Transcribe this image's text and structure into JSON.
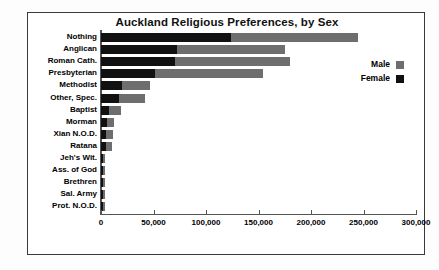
{
  "chart_data": {
    "type": "bar",
    "orientation": "horizontal",
    "stacked": true,
    "title": "Auckland Religious Preferences, by Sex",
    "xlabel": "",
    "ylabel": "",
    "xlim": [
      0,
      300000
    ],
    "xticks": [
      0,
      50000,
      100000,
      150000,
      200000,
      250000,
      300000
    ],
    "xticklabels": [
      "0",
      "50,000",
      "100,000",
      "150,000",
      "200,000",
      "250,000",
      "300,000"
    ],
    "grid": false,
    "legend_position": "upper right",
    "categories": [
      "Nothing",
      "Anglican",
      "Roman Cath.",
      "Presbyterian",
      "Methodist",
      "Other, Spec.",
      "Baptist",
      "Morman",
      "Xian N.O.D.",
      "Ratana",
      "Jeh's Wit.",
      "Ass. of God",
      "Brethren",
      "Sal. Army",
      "Prot. N.O.D."
    ],
    "series": [
      {
        "name": "Female",
        "color": "#111111",
        "values": [
          124000,
          72000,
          70000,
          51000,
          20000,
          17000,
          8000,
          6000,
          5000,
          5000,
          2000,
          2000,
          2000,
          2000,
          2000
        ]
      },
      {
        "name": "Male",
        "color": "#6e6e6e",
        "values": [
          121000,
          103000,
          110000,
          103000,
          27000,
          25000,
          11000,
          6000,
          6000,
          5000,
          1500,
          1500,
          1500,
          1500,
          1500
        ]
      }
    ],
    "totals": [
      245000,
      175000,
      180000,
      154000,
      47000,
      42000,
      19000,
      12000,
      11000,
      10000,
      3500,
      3500,
      3500,
      3500,
      3500
    ]
  },
  "legend": {
    "items": [
      {
        "label": "Male",
        "swatch": "m"
      },
      {
        "label": "Female",
        "swatch": "f"
      }
    ]
  }
}
